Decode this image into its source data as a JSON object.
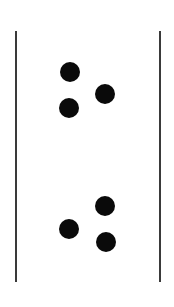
{
  "figure": {
    "canvas": {
      "width": 174,
      "height": 307,
      "background_color": "#ffffff"
    },
    "lines": {
      "color": "#3a3a3a",
      "thickness": 2,
      "items": [
        {
          "name": "left-vertical-line",
          "x": 16,
          "y_top": 31,
          "y_bottom": 282
        },
        {
          "name": "right-vertical-line",
          "x": 160,
          "y_top": 31,
          "y_bottom": 282
        }
      ]
    },
    "dots": {
      "color": "#0a0a0a",
      "diameter": 20,
      "groups": [
        {
          "name": "upper-dot-cluster",
          "label": "upper group",
          "count": 3,
          "items": [
            {
              "name": "upper-dot-top-left",
              "cx": 70,
              "cy": 72
            },
            {
              "name": "upper-dot-right",
              "cx": 105,
              "cy": 94
            },
            {
              "name": "upper-dot-bottom-left",
              "cx": 69,
              "cy": 108
            }
          ]
        },
        {
          "name": "lower-dot-cluster",
          "label": "lower group",
          "count": 3,
          "items": [
            {
              "name": "lower-dot-top-right",
              "cx": 105,
              "cy": 206
            },
            {
              "name": "lower-dot-left",
              "cx": 69,
              "cy": 229
            },
            {
              "name": "lower-dot-bottom-right",
              "cx": 106,
              "cy": 242
            }
          ]
        }
      ]
    }
  }
}
